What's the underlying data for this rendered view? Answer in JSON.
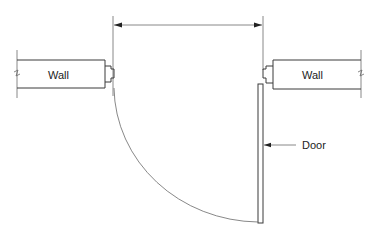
{
  "diagram": {
    "labels": {
      "left_wall": "Wall",
      "right_wall": "Wall",
      "door": "Door"
    },
    "colors": {
      "line": "#3a3a3a",
      "background": "#ffffff"
    }
  }
}
